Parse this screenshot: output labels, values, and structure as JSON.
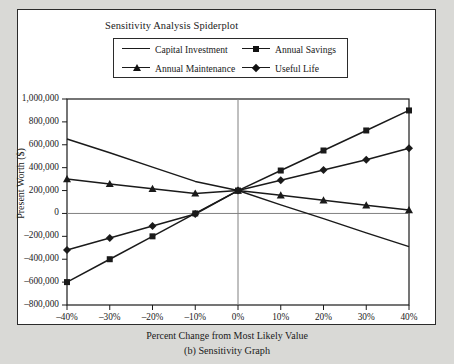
{
  "figure": {
    "caption": "(b) Sensitivity Graph"
  },
  "chart_data": {
    "type": "line",
    "title": "Sensitivity Analysis Spiderplot",
    "xlabel": "Percent Change from Most Likely Value",
    "ylabel": "Present Worth ($)",
    "x": [
      -40,
      -30,
      -20,
      -10,
      0,
      10,
      20,
      30,
      40
    ],
    "xtick_labels": [
      "–40%",
      "–30%",
      "–20%",
      "–10%",
      "0%",
      "10%",
      "20%",
      "30%",
      "40%"
    ],
    "ytick_labels": [
      "1,000,000",
      "800,000",
      "600,000",
      "400,000",
      "200,000",
      "0",
      "–200,000",
      "–400,000",
      "–600,000",
      "–800,000"
    ],
    "ytick_values": [
      1000000,
      800000,
      600000,
      400000,
      200000,
      0,
      -200000,
      -400000,
      -600000,
      -800000
    ],
    "xlim": [
      -40,
      40
    ],
    "ylim": [
      -800000,
      1000000
    ],
    "grid": false,
    "legend_position": "top",
    "line_color": "#1a1a1a",
    "series": [
      {
        "name": "Capital Investment",
        "marker": "none",
        "values": [
          650000,
          530000,
          405000,
          280000,
          200000,
          75000,
          -45000,
          -170000,
          -290000
        ]
      },
      {
        "name": "Annual Savings",
        "marker": "square",
        "values": [
          -600000,
          -400000,
          -200000,
          0,
          200000,
          375000,
          550000,
          725000,
          900000
        ]
      },
      {
        "name": "Annual Maintenance",
        "marker": "triangle",
        "values": [
          300000,
          258000,
          215000,
          175000,
          200000,
          158000,
          115000,
          72000,
          30000
        ]
      },
      {
        "name": "Useful Life",
        "marker": "diamond",
        "values": [
          -320000,
          -215000,
          -110000,
          -5000,
          200000,
          290000,
          380000,
          470000,
          570000
        ]
      }
    ]
  }
}
